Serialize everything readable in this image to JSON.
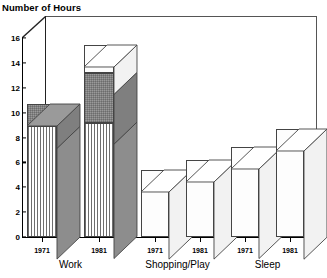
{
  "chart_data": {
    "type": "bar",
    "title": "Number of Hours",
    "xlabel": "",
    "ylabel": "Number of Hours",
    "ylim": [
      0,
      16
    ],
    "ytick_values": [
      0,
      2,
      4,
      6,
      8,
      10,
      12,
      14,
      16
    ],
    "ytick_labels": [
      "0",
      "2",
      "4",
      "6",
      "8",
      "10",
      "12",
      "14",
      "16"
    ],
    "grid": false,
    "legend": "none",
    "style": "3d-stacked-bar",
    "groups": [
      "Work",
      "Shopping/Play",
      "Sleep"
    ],
    "categories": [
      "1971",
      "1981",
      "1971",
      "1981",
      "1971",
      "1981"
    ],
    "bars": [
      {
        "group": "Work",
        "year": "1971",
        "total": 10.7,
        "segments": [
          {
            "name": "striped",
            "value": 8.9,
            "fill": "vertical-stripes"
          },
          {
            "name": "gray",
            "value": 1.8,
            "fill": "gray"
          }
        ]
      },
      {
        "group": "Work",
        "year": "1981",
        "total": 15.4,
        "segments": [
          {
            "name": "striped",
            "value": 9.2,
            "fill": "vertical-stripes"
          },
          {
            "name": "gray",
            "value": 4.0,
            "fill": "gray"
          },
          {
            "name": "white",
            "value": 2.2,
            "fill": "white"
          }
        ]
      },
      {
        "group": "Shopping/Play",
        "year": "1971",
        "total": 5.4,
        "segments": [
          {
            "name": "white",
            "value": 5.4,
            "fill": "white"
          }
        ]
      },
      {
        "group": "Shopping/Play",
        "year": "1981",
        "total": 6.2,
        "segments": [
          {
            "name": "white",
            "value": 6.2,
            "fill": "white"
          }
        ]
      },
      {
        "group": "Sleep",
        "year": "1971",
        "total": 7.2,
        "segments": [
          {
            "name": "white",
            "value": 7.2,
            "fill": "white"
          }
        ]
      },
      {
        "group": "Sleep",
        "year": "1981",
        "total": 8.7,
        "segments": [
          {
            "name": "white",
            "value": 8.7,
            "fill": "white"
          }
        ]
      }
    ],
    "colors": {
      "striped": "#6e6e6e",
      "gray": "#9a9a9a",
      "white": "#fdfdfd",
      "outline": "#444444",
      "axis": "#000000",
      "shadow": "#000000",
      "background": "#ffffff"
    }
  }
}
